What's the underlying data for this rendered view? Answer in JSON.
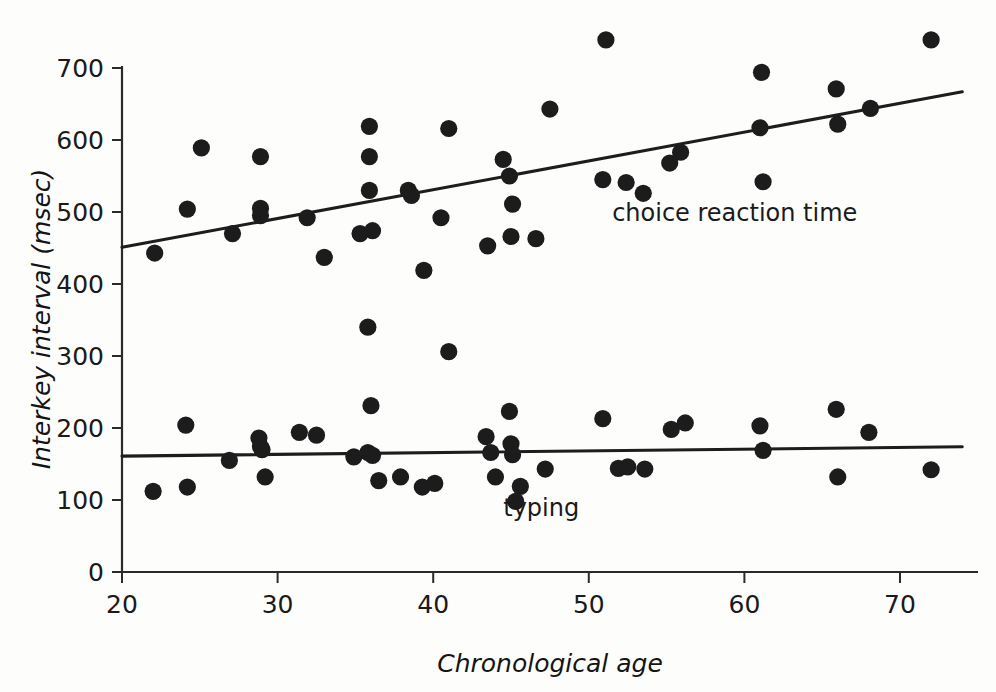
{
  "chart_data": {
    "type": "scatter",
    "title": "",
    "xlabel": "Chronological age",
    "ylabel": "Interkey interval (msec)",
    "xlim": [
      20,
      75
    ],
    "ylim": [
      0,
      700
    ],
    "xticks": [
      20,
      30,
      40,
      50,
      60,
      70
    ],
    "yticks": [
      0,
      100,
      200,
      300,
      400,
      500,
      600,
      700
    ],
    "grid": false,
    "legend_position": "inline-annotation",
    "series": [
      {
        "name": "choice reaction time",
        "label": "choice reaction time",
        "label_x": 51.5,
        "label_y": 487,
        "marker": "filled-circle",
        "color": "#1c1c1c",
        "points": [
          {
            "x": 22.1,
            "y": 443
          },
          {
            "x": 24.2,
            "y": 504
          },
          {
            "x": 25.1,
            "y": 589
          },
          {
            "x": 27.1,
            "y": 470
          },
          {
            "x": 28.9,
            "y": 577
          },
          {
            "x": 28.9,
            "y": 505
          },
          {
            "x": 28.9,
            "y": 495
          },
          {
            "x": 31.9,
            "y": 492
          },
          {
            "x": 33.0,
            "y": 437
          },
          {
            "x": 35.3,
            "y": 470
          },
          {
            "x": 35.9,
            "y": 619
          },
          {
            "x": 35.9,
            "y": 577
          },
          {
            "x": 35.9,
            "y": 530
          },
          {
            "x": 36.1,
            "y": 474
          },
          {
            "x": 35.8,
            "y": 340
          },
          {
            "x": 36.0,
            "y": 231
          },
          {
            "x": 38.4,
            "y": 530
          },
          {
            "x": 38.6,
            "y": 523
          },
          {
            "x": 39.4,
            "y": 419
          },
          {
            "x": 40.5,
            "y": 492
          },
          {
            "x": 41.0,
            "y": 616
          },
          {
            "x": 41.0,
            "y": 306
          },
          {
            "x": 43.5,
            "y": 453
          },
          {
            "x": 44.5,
            "y": 573
          },
          {
            "x": 44.9,
            "y": 550
          },
          {
            "x": 45.1,
            "y": 511
          },
          {
            "x": 45.0,
            "y": 466
          },
          {
            "x": 46.6,
            "y": 463
          },
          {
            "x": 47.5,
            "y": 643
          },
          {
            "x": 51.1,
            "y": 739
          },
          {
            "x": 50.9,
            "y": 545
          },
          {
            "x": 52.4,
            "y": 541
          },
          {
            "x": 53.5,
            "y": 526
          },
          {
            "x": 55.2,
            "y": 568
          },
          {
            "x": 55.9,
            "y": 583
          },
          {
            "x": 61.1,
            "y": 694
          },
          {
            "x": 61.0,
            "y": 617
          },
          {
            "x": 61.2,
            "y": 542
          },
          {
            "x": 65.9,
            "y": 671
          },
          {
            "x": 66.0,
            "y": 622
          },
          {
            "x": 68.1,
            "y": 644
          },
          {
            "x": 72.0,
            "y": 739
          }
        ],
        "fit_line": {
          "x1": 20,
          "y1": 451,
          "x2": 74,
          "y2": 667
        }
      },
      {
        "name": "typing",
        "label": "typing",
        "label_x": 44.5,
        "label_y": 78,
        "marker": "filled-circle",
        "color": "#1c1c1c",
        "points": [
          {
            "x": 22.0,
            "y": 112
          },
          {
            "x": 24.1,
            "y": 204
          },
          {
            "x": 24.2,
            "y": 118
          },
          {
            "x": 26.9,
            "y": 155
          },
          {
            "x": 28.8,
            "y": 186
          },
          {
            "x": 28.9,
            "y": 174
          },
          {
            "x": 29.0,
            "y": 170
          },
          {
            "x": 29.2,
            "y": 132
          },
          {
            "x": 31.4,
            "y": 194
          },
          {
            "x": 32.5,
            "y": 190
          },
          {
            "x": 34.9,
            "y": 160
          },
          {
            "x": 35.8,
            "y": 166
          },
          {
            "x": 36.1,
            "y": 162
          },
          {
            "x": 36.5,
            "y": 127
          },
          {
            "x": 37.9,
            "y": 132
          },
          {
            "x": 39.3,
            "y": 118
          },
          {
            "x": 40.1,
            "y": 123
          },
          {
            "x": 43.4,
            "y": 188
          },
          {
            "x": 43.7,
            "y": 166
          },
          {
            "x": 44.0,
            "y": 132
          },
          {
            "x": 44.9,
            "y": 223
          },
          {
            "x": 45.0,
            "y": 178
          },
          {
            "x": 45.1,
            "y": 163
          },
          {
            "x": 45.6,
            "y": 119
          },
          {
            "x": 45.3,
            "y": 98
          },
          {
            "x": 47.2,
            "y": 143
          },
          {
            "x": 50.9,
            "y": 213
          },
          {
            "x": 51.9,
            "y": 144
          },
          {
            "x": 52.5,
            "y": 146
          },
          {
            "x": 53.6,
            "y": 143
          },
          {
            "x": 55.3,
            "y": 198
          },
          {
            "x": 56.2,
            "y": 207
          },
          {
            "x": 61.0,
            "y": 203
          },
          {
            "x": 61.2,
            "y": 169
          },
          {
            "x": 65.9,
            "y": 226
          },
          {
            "x": 66.0,
            "y": 132
          },
          {
            "x": 68.0,
            "y": 194
          },
          {
            "x": 72.0,
            "y": 142
          }
        ],
        "fit_line": {
          "x1": 20,
          "y1": 161,
          "x2": 74,
          "y2": 174
        }
      }
    ]
  },
  "axes": {
    "y_title": "Interkey interval (msec)",
    "x_title": "Chronological age",
    "y_tick_labels": [
      "0",
      "100",
      "200",
      "300",
      "400",
      "500",
      "600",
      "700"
    ],
    "x_tick_labels": [
      "20",
      "30",
      "40",
      "50",
      "60",
      "70"
    ]
  },
  "colors": {
    "marker": "#1c1c1c",
    "axis": "#2b2b2b",
    "fit": "#1d1d1d",
    "background": "#fdfdfc"
  }
}
